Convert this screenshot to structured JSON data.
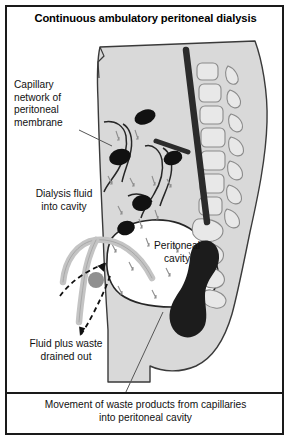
{
  "figure": {
    "title": "Continuous ambulatory peritoneal dialysis",
    "caption": "Movement of waste products from capillaries\ninto peritoneal cavity"
  },
  "labels": {
    "capillary_network": "Capillary\nnetwork of\nperitoneal\nmembrane",
    "dialysis_fluid": "Dialysis fluid\ninto cavity",
    "peritoneal_cavity": "Peritoneal\ncavity",
    "fluid_drained": "Fluid plus waste\ndrained out"
  },
  "colors": {
    "frame": "#1a1a1a",
    "body_fill": "#d9d9d9",
    "body_outline": "#3a3a3a",
    "cavity_fill": "#ffffff",
    "bone_fill": "#e8e8e8",
    "bone_outline": "#8a8a8a",
    "vessel_dark": "#111111",
    "spine_cord": "#2b2b2b",
    "bowel_dark": "#1c1c1c",
    "catheter": "#c4c4c4",
    "catheter_outline": "#9a9a9a",
    "junction": "#8f8f8f",
    "arrow": "#111111",
    "leader_line": "#555555",
    "text": "#111111",
    "background": "#ffffff"
  },
  "diagram": {
    "type": "anatomical-cross-section",
    "view": "sagittal abdomen",
    "structures": [
      "abdominal body wall",
      "lumbar vertebrae",
      "sacrum",
      "spinal cord",
      "peritoneal cavity",
      "peritoneal membrane capillaries",
      "rectum and sigmoid colon",
      "dialysis catheter"
    ],
    "flow_arrows": [
      "dialysis fluid into cavity",
      "fluid plus waste drained out",
      "waste products from capillaries into cavity"
    ]
  }
}
